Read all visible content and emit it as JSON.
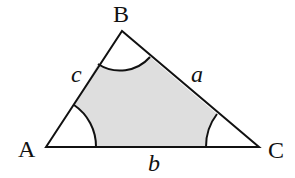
{
  "diagram": {
    "title": "",
    "type": "triangle",
    "colors": {
      "stroke": "#111111",
      "shaded_region": "#dedede",
      "background": "#ffffff"
    },
    "vertices": [
      {
        "id": "A",
        "label": "A",
        "x": 46,
        "y": 147
      },
      {
        "id": "B",
        "label": "B",
        "x": 122,
        "y": 31
      },
      {
        "id": "C",
        "label": "C",
        "x": 259,
        "y": 147
      }
    ],
    "sides": [
      {
        "id": "a",
        "label": "a",
        "between": [
          "B",
          "C"
        ]
      },
      {
        "id": "b",
        "label": "b",
        "between": [
          "A",
          "C"
        ]
      },
      {
        "id": "c",
        "label": "c",
        "between": [
          "A",
          "B"
        ]
      }
    ],
    "angle_arcs": [
      {
        "vertex": "A",
        "radius": 50
      },
      {
        "vertex": "B",
        "radius": 40
      },
      {
        "vertex": "C",
        "radius": 53
      }
    ],
    "shading": "region of triangle outside the three angle arcs"
  }
}
